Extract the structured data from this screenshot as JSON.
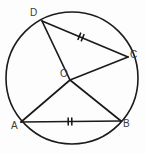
{
  "figure": {
    "background_color": "#fdfdfd",
    "stroke_color": "#1b1b1b",
    "label_color": "#3a3a3a",
    "circle": {
      "center_label": "O",
      "center_x": 72,
      "center_y": 78,
      "radius": 66
    },
    "points": [
      {
        "id": "D",
        "label": "D",
        "x": 42,
        "y": 21,
        "label_x": 30,
        "label_y": 8
      },
      {
        "id": "C",
        "label": "C",
        "x": 128,
        "y": 57,
        "label_x": 130,
        "label_y": 50
      },
      {
        "id": "O",
        "label": "O",
        "x": 70,
        "y": 80,
        "label_x": 60,
        "label_y": 69
      },
      {
        "id": "A",
        "label": "A",
        "x": 21,
        "y": 122,
        "label_x": 11,
        "label_y": 121
      },
      {
        "id": "B",
        "label": "B",
        "x": 121,
        "y": 121,
        "label_x": 123,
        "label_y": 119
      }
    ],
    "segments": [
      {
        "id": "DC",
        "from": "D",
        "to": "C",
        "kind": "chord",
        "ticks": 2
      },
      {
        "id": "AB",
        "from": "A",
        "to": "B",
        "kind": "chord",
        "ticks": 2
      },
      {
        "id": "OD",
        "from": "O",
        "to": "D",
        "kind": "radius",
        "ticks": 0
      },
      {
        "id": "OC",
        "from": "O",
        "to": "C",
        "kind": "radius",
        "ticks": 0
      },
      {
        "id": "OA",
        "from": "O",
        "to": "A",
        "kind": "radius",
        "ticks": 0
      },
      {
        "id": "OB",
        "from": "O",
        "to": "B",
        "kind": "radius",
        "ticks": 0
      }
    ],
    "tick_marks": [
      {
        "on_segment": "DC",
        "count": 2,
        "x": 81,
        "y": 37
      },
      {
        "on_segment": "AB",
        "count": 2,
        "x": 70,
        "y": 122
      }
    ]
  }
}
